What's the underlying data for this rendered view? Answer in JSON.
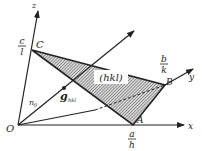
{
  "diagram": {
    "axes": {
      "x": "x",
      "y": "y",
      "z": "z"
    },
    "origin": "O",
    "points": {
      "A": "A",
      "B": "B",
      "C": "C"
    },
    "intercepts": {
      "a_num": "a",
      "a_den": "h",
      "b_num": "b",
      "b_den": "k",
      "c_num": "c",
      "c_den": "l"
    },
    "plane_label": "(hkl)",
    "vector_label": "g",
    "vector_subscript": "hkl",
    "normal_label": "n",
    "normal_subscript": "0",
    "colors": {
      "line": "#222222",
      "hatch": "#555555",
      "background": "#ffffff"
    }
  }
}
